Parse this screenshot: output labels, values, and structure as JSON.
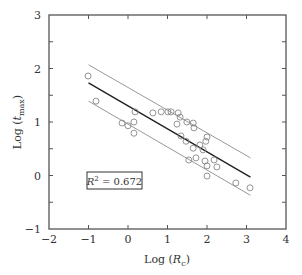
{
  "chart_data": {
    "type": "scatter",
    "title": "",
    "xlabel": "Log (R_c)",
    "xlabel_parts": {
      "prefix": "Log (",
      "var": "R",
      "sub": "c",
      "suffix": ")"
    },
    "ylabel": "Log (t_max)",
    "ylabel_parts": {
      "prefix": "Log (",
      "var": "t",
      "sub": "max",
      "suffix": ")"
    },
    "xlim": [
      -2,
      4
    ],
    "ylim": [
      -1,
      3
    ],
    "xticks": [
      -2,
      -1,
      0,
      1,
      2,
      3,
      4
    ],
    "yticks": [
      -1,
      0,
      1,
      2,
      3
    ],
    "xtick_labels": [
      "−2",
      "−1",
      "0",
      "1",
      "2",
      "3",
      "4"
    ],
    "ytick_labels": [
      "−1",
      "0",
      "1",
      "2",
      "3"
    ],
    "grid": false,
    "legend": null,
    "annotation": {
      "text": "R² = 0.672",
      "var": "R",
      "sup": "2",
      "rest": " = 0.672",
      "x": -0.9,
      "y": 0.0
    },
    "series": [
      {
        "name": "observations",
        "marker": "open-circle",
        "points": [
          [
            -1.01,
            1.86
          ],
          [
            -0.81,
            1.39
          ],
          [
            -0.15,
            0.98
          ],
          [
            0.0,
            0.93
          ],
          [
            0.15,
            0.79
          ],
          [
            0.18,
            1.19
          ],
          [
            0.15,
            1.0
          ],
          [
            0.63,
            1.17
          ],
          [
            0.84,
            1.19
          ],
          [
            1.01,
            1.19
          ],
          [
            1.09,
            1.19
          ],
          [
            1.27,
            1.17
          ],
          [
            1.32,
            1.09
          ],
          [
            1.24,
            0.96
          ],
          [
            1.49,
            1.0
          ],
          [
            1.65,
            0.98
          ],
          [
            1.67,
            0.89
          ],
          [
            1.34,
            0.74
          ],
          [
            1.47,
            0.64
          ],
          [
            1.65,
            0.51
          ],
          [
            1.82,
            0.57
          ],
          [
            1.97,
            0.64
          ],
          [
            2.0,
            0.72
          ],
          [
            1.9,
            0.48
          ],
          [
            1.72,
            0.33
          ],
          [
            1.54,
            0.29
          ],
          [
            1.95,
            0.27
          ],
          [
            2.18,
            0.29
          ],
          [
            2.0,
            0.18
          ],
          [
            2.25,
            0.16
          ],
          [
            2.0,
            -0.01
          ],
          [
            2.73,
            -0.14
          ],
          [
            3.09,
            -0.23
          ]
        ]
      },
      {
        "name": "regression",
        "type": "line",
        "color": "#222222",
        "points": [
          [
            -1.0,
            1.73
          ],
          [
            3.1,
            -0.03
          ]
        ]
      },
      {
        "name": "upper-bound",
        "type": "line",
        "color": "#999999",
        "points": [
          [
            -1.0,
            2.07
          ],
          [
            3.1,
            0.33
          ]
        ]
      },
      {
        "name": "lower-bound",
        "type": "line",
        "color": "#999999",
        "points": [
          [
            -1.0,
            1.39
          ],
          [
            3.1,
            -0.37
          ]
        ]
      }
    ],
    "colors": {
      "axis": "#555555",
      "marker": "#888888",
      "fit": "#222222",
      "band": "#999999",
      "text": "#333333"
    }
  }
}
